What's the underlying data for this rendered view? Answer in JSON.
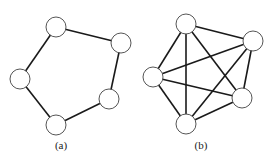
{
  "figures": [
    {
      "id": "a",
      "label": "(a)",
      "label_pos": [
        61,
        149
      ],
      "nodes": [
        [
          56,
          27
        ],
        [
          121,
          43
        ],
        [
          20,
          79
        ],
        [
          109,
          99
        ],
        [
          56,
          125
        ]
      ],
      "edges": [
        [
          0,
          1
        ],
        [
          1,
          3
        ],
        [
          3,
          4
        ],
        [
          4,
          2
        ],
        [
          2,
          0
        ]
      ]
    },
    {
      "id": "b",
      "label": "(b)",
      "label_pos": [
        201,
        149
      ],
      "nodes": [
        [
          186,
          24
        ],
        [
          253,
          41
        ],
        [
          153,
          77
        ],
        [
          242,
          98
        ],
        [
          186,
          124
        ]
      ],
      "edges": [
        [
          0,
          1
        ],
        [
          0,
          2
        ],
        [
          0,
          3
        ],
        [
          0,
          4
        ],
        [
          1,
          2
        ],
        [
          1,
          3
        ],
        [
          1,
          4
        ],
        [
          2,
          3
        ],
        [
          2,
          4
        ],
        [
          3,
          4
        ]
      ]
    }
  ],
  "style": {
    "node_radius": 10,
    "edge_color": "#1a1a1a",
    "node_stroke": "#555555",
    "node_fill": "#ffffff"
  }
}
